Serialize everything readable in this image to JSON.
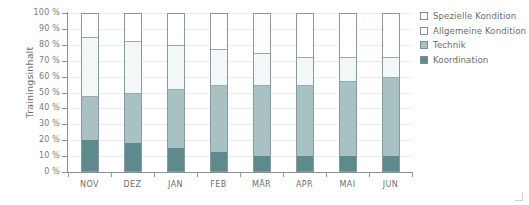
{
  "chart_data": {
    "type": "bar",
    "subtype": "stacked-100-percent",
    "title": "",
    "xlabel": "",
    "ylabel": "Trainingsinhalt",
    "ylim": [
      0,
      100
    ],
    "yunit": "%",
    "grid": true,
    "legend_position": "right",
    "categories": [
      "NOV",
      "DEZ",
      "JAN",
      "FEB",
      "MÄR",
      "APR",
      "MAI",
      "JUN"
    ],
    "ytick_labels": [
      "0 %",
      "10 %",
      "20 %",
      "30 %",
      "40 %",
      "50 %",
      "60 %",
      "70 %",
      "80 %",
      "90 %",
      "100 %"
    ],
    "ytick_values": [
      0,
      10,
      20,
      30,
      40,
      50,
      60,
      70,
      80,
      90,
      100
    ],
    "series": [
      {
        "name": "Koordination",
        "color": "#5d8a8c",
        "values": [
          20,
          18,
          15,
          12.5,
          10,
          10,
          10,
          10
        ]
      },
      {
        "name": "Technik",
        "color": "#a8c2c4",
        "values": [
          27.5,
          32,
          37.5,
          42.5,
          45,
          45,
          47.5,
          50
        ]
      },
      {
        "name": "Allgemeine Kondition",
        "color": "#f2f7f8",
        "values": [
          37.5,
          32.5,
          27.5,
          22.5,
          20,
          17.5,
          15,
          12.5
        ]
      },
      {
        "name": "Spezielle Kondition",
        "color": "#ffffff",
        "values": [
          15,
          17.5,
          20,
          22.5,
          25,
          27.5,
          27.5,
          27.5
        ]
      }
    ],
    "cumulative_tops": {
      "NOV": [
        20,
        47.5,
        85,
        100
      ],
      "DEZ": [
        18,
        50,
        82.5,
        100
      ],
      "JAN": [
        15,
        52.5,
        80,
        100
      ],
      "FEB": [
        12.5,
        55,
        77.5,
        100
      ],
      "MÄR": [
        10,
        55,
        75,
        100
      ],
      "APR": [
        10,
        55,
        72.5,
        100
      ],
      "MAI": [
        10,
        57.5,
        72.5,
        100
      ],
      "JUN": [
        10,
        60,
        72.5,
        100
      ]
    }
  },
  "legend": {
    "items": [
      {
        "label": "Spezielle Kondition",
        "color": "#ffffff"
      },
      {
        "label": "Allgemeine Kondition",
        "color": "#ffffff"
      },
      {
        "label": "Technik",
        "color": "#a8c2c4"
      },
      {
        "label": "Koordination",
        "color": "#5d8a8c"
      }
    ]
  },
  "axis": {
    "y_title": "Trainingsinhalt"
  }
}
